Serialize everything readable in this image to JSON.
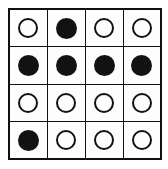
{
  "figure": {
    "kind": "circle-grid-puzzle",
    "rows": 4,
    "columns": 4,
    "background_color": "#ffffff",
    "cell_background_color": "#fdfdfd",
    "grid_line_color": "#111111",
    "token_color": "#121212",
    "token_open_label": "open circle",
    "token_filled_label": "filled circle"
  },
  "grid": {
    "cells": [
      [
        {
          "state": "open",
          "label": "open circle"
        },
        {
          "state": "filled",
          "label": "filled circle"
        },
        {
          "state": "open",
          "label": "open circle"
        },
        {
          "state": "open",
          "label": "open circle"
        }
      ],
      [
        {
          "state": "filled",
          "label": "filled circle"
        },
        {
          "state": "filled",
          "label": "filled circle"
        },
        {
          "state": "filled",
          "label": "filled circle"
        },
        {
          "state": "filled",
          "label": "filled circle"
        }
      ],
      [
        {
          "state": "open",
          "label": "open circle"
        },
        {
          "state": "open",
          "label": "open circle"
        },
        {
          "state": "open",
          "label": "open circle"
        },
        {
          "state": "open",
          "label": "open circle"
        }
      ],
      [
        {
          "state": "filled",
          "label": "filled circle"
        },
        {
          "state": "open",
          "label": "open circle"
        },
        {
          "state": "open",
          "label": "open circle"
        },
        {
          "state": "open",
          "label": "open circle"
        }
      ]
    ]
  }
}
